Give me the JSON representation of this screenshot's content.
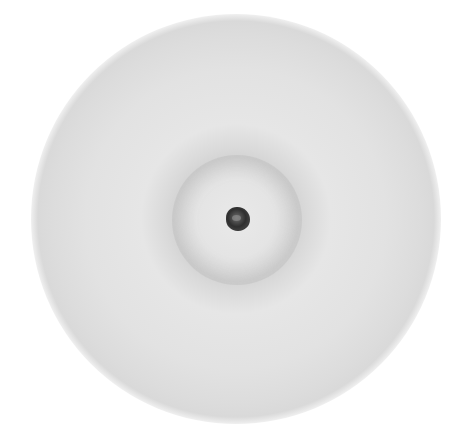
{
  "image": {
    "description": "Grayscale circular disk with a faint inner ring and a small dark particle at center",
    "colors": {
      "background": "#ffffff",
      "disk": "#e2e2e2",
      "ring": "#d4d4d4",
      "particle": "#333333"
    }
  }
}
